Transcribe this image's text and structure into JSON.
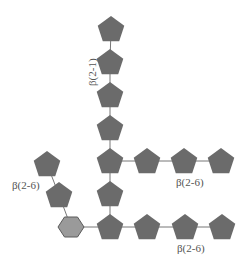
{
  "diagram": {
    "title": "",
    "colors": {
      "pentagon_fill": "#6b6b6b",
      "hexagon_fill": "#9a9a9a",
      "hexagon_stroke": "#5a5a5a",
      "link": "#777777",
      "label": "#555555"
    },
    "labels": {
      "main_chain_linkage": "β(2-1)",
      "left_branch_linkage": "β(2-6)",
      "middle_branch_linkage": "β(2-6)",
      "bottom_branch_linkage": "β(2-6)"
    },
    "nodes": {
      "hexagon": {
        "shape": "hexagon",
        "x": 71,
        "y": 227
      },
      "main_chain": [
        {
          "shape": "pentagon",
          "x": 111,
          "y": 29
        },
        {
          "shape": "pentagon",
          "x": 110,
          "y": 62
        },
        {
          "shape": "pentagon",
          "x": 110,
          "y": 95
        },
        {
          "shape": "pentagon",
          "x": 110,
          "y": 128
        },
        {
          "shape": "pentagon",
          "x": 110,
          "y": 161
        },
        {
          "shape": "pentagon",
          "x": 110,
          "y": 194
        },
        {
          "shape": "pentagon",
          "x": 110,
          "y": 227
        }
      ],
      "middle_branch": [
        {
          "shape": "pentagon",
          "x": 147,
          "y": 161
        },
        {
          "shape": "pentagon",
          "x": 184,
          "y": 161
        },
        {
          "shape": "pentagon",
          "x": 221,
          "y": 161
        }
      ],
      "bottom_branch": [
        {
          "shape": "pentagon",
          "x": 147,
          "y": 227
        },
        {
          "shape": "pentagon",
          "x": 185,
          "y": 227
        },
        {
          "shape": "pentagon",
          "x": 222,
          "y": 227
        }
      ],
      "left_branch": [
        {
          "shape": "pentagon",
          "x": 47,
          "y": 164
        },
        {
          "shape": "pentagon",
          "x": 59,
          "y": 195
        }
      ]
    }
  }
}
